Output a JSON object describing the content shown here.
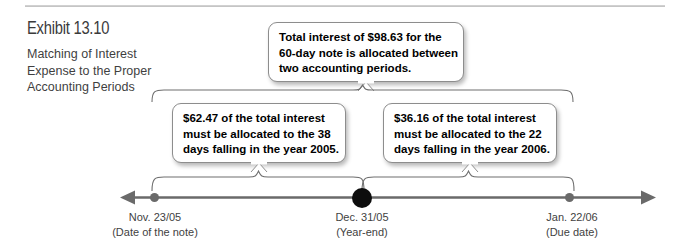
{
  "exhibit": {
    "number_label": "Exhibit 13.10",
    "subtitle_line1": "Matching of Interest",
    "subtitle_line2": "Expense to the Proper",
    "subtitle_line3": "Accounting Periods"
  },
  "callouts": {
    "top": {
      "line1": "Total interest of $98.63 for the",
      "line2": "60-day note is allocated between",
      "line3": "two accounting periods."
    },
    "left": {
      "line1": "$62.47 of the total interest",
      "line2": "must be allocated to the 38",
      "line3": "days falling in the year 2005."
    },
    "right": {
      "line1": "$36.16 of the total interest",
      "line2": "must be allocated to the 22",
      "line3": "days falling in the year 2006."
    }
  },
  "timeline": {
    "points": [
      {
        "date": "Nov. 23/05",
        "note": "(Date of the note)"
      },
      {
        "date": "Dec. 31/05",
        "note": "(Year-end)"
      },
      {
        "date": "Jan. 22/06",
        "note": "(Due date)"
      }
    ]
  },
  "colors": {
    "axis": "#6a6a6a",
    "marker_highlight": "#0d0d0d",
    "text": "#3f3f3f",
    "box_border": "#8d8d8d",
    "rule": "#c9c9c9"
  }
}
